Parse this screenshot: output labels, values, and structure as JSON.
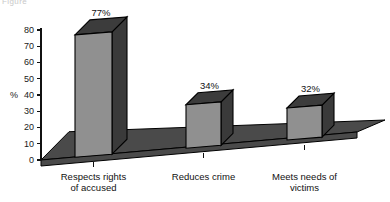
{
  "page": {
    "faint_header": "Figure"
  },
  "chart_data": {
    "type": "bar",
    "title": "",
    "subtitle": "",
    "xlabel": "",
    "ylabel": "%",
    "categories": [
      "Respects rights of accused",
      "Reduces crime",
      "Meets needs of victims"
    ],
    "category_lines": [
      [
        "Respects rights",
        "of accused"
      ],
      [
        "Reduces crime",
        ""
      ],
      [
        "Meets needs of",
        "victims"
      ]
    ],
    "values": [
      77,
      34,
      32
    ],
    "value_labels": [
      "77%",
      "34%",
      "32%"
    ],
    "ylim": [
      0,
      80
    ],
    "yticks": [
      0,
      10,
      20,
      30,
      40,
      50,
      60,
      70,
      80
    ],
    "ytick_labels": [
      "0",
      "10",
      "20",
      "30",
      "40",
      "50",
      "60",
      "70",
      "80"
    ],
    "grid": false,
    "legend": false,
    "style": "3d-blocks",
    "colors": {
      "bar_front": "#909090",
      "bar_top": "#3c3c3c",
      "bar_side": "#3a3a3a",
      "floor": "#4a4a4a",
      "outline": "#000000",
      "text": "#111111",
      "background": "#ffffff"
    }
  }
}
